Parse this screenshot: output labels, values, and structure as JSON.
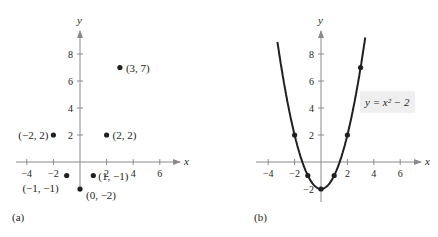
{
  "chart_data": [
    {
      "type": "scatter",
      "panel_label": "(a)",
      "xlabel": "x",
      "ylabel": "y",
      "x_ticks": [
        -4,
        -2,
        2,
        4,
        6
      ],
      "y_ticks": [
        2,
        4,
        6,
        8
      ],
      "xlim": [
        -5,
        7
      ],
      "ylim": [
        -3,
        10
      ],
      "grid": false,
      "points": [
        {
          "x": -2,
          "y": 2,
          "label": "(−2, 2)"
        },
        {
          "x": -1,
          "y": -1,
          "label": "(−1, −1)"
        },
        {
          "x": 0,
          "y": -2,
          "label": "(0, −2)"
        },
        {
          "x": 1,
          "y": -1,
          "label": "(1, −1)"
        },
        {
          "x": 2,
          "y": 2,
          "label": "(2, 2)"
        },
        {
          "x": 3,
          "y": 7,
          "label": "(3, 7)"
        }
      ]
    },
    {
      "type": "line",
      "panel_label": "(b)",
      "xlabel": "x",
      "ylabel": "y",
      "x_ticks": [
        -4,
        -2,
        2,
        4,
        6
      ],
      "y_ticks": [
        -2,
        2,
        4,
        6,
        8
      ],
      "xlim": [
        -5,
        7
      ],
      "ylim": [
        -3,
        10
      ],
      "grid": false,
      "equation_label": "y = x² − 2",
      "curve": "y = x^2 - 2",
      "points": [
        {
          "x": -2,
          "y": 2
        },
        {
          "x": -1,
          "y": -1
        },
        {
          "x": 0,
          "y": -2
        },
        {
          "x": 1,
          "y": -1
        },
        {
          "x": 2,
          "y": 2
        },
        {
          "x": 3,
          "y": 7
        }
      ]
    }
  ],
  "panels": {
    "a": {
      "label": "(a)",
      "xlabel": "x",
      "ylabel": "y"
    },
    "b": {
      "label": "(b)",
      "xlabel": "x",
      "ylabel": "y",
      "equation": "y = x² − 2"
    }
  }
}
